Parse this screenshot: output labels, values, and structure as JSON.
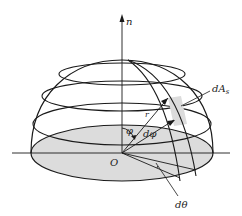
{
  "diagram": {
    "labels": {
      "normal": "n",
      "area": "dA",
      "area_sub": "s",
      "radius": "r",
      "polar_angle": "φ",
      "polar_increment": "dφ",
      "origin": "O",
      "azimuth_increment": "dθ"
    },
    "colors": {
      "stroke": "#1a1a1a",
      "base_fill": "#dcdcdc",
      "patch_fill": "#dcdcdc",
      "background": "#ffffff"
    }
  }
}
